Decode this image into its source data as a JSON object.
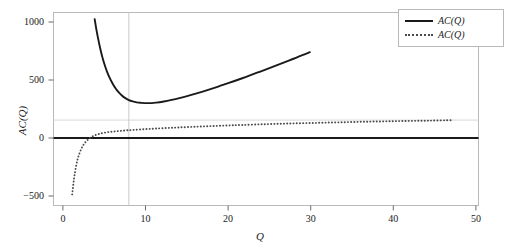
{
  "chart_data": {
    "type": "line",
    "title": "",
    "subtitle": "",
    "xlabel": "Q",
    "ylabel": "AC(Q)",
    "xlim": [
      -1.2,
      53.5
    ],
    "ylim": [
      -620,
      1120
    ],
    "xticks": [
      0,
      10,
      20,
      30,
      40,
      50
    ],
    "xtick_labels": [
      "0",
      "10",
      "20",
      "30",
      "40",
      "50"
    ],
    "yticks": [
      -500,
      0,
      500,
      1000
    ],
    "ytick_labels": [
      "−500",
      "0",
      "500",
      "1000"
    ],
    "grid": true,
    "gridlines": {
      "horizontal": [
        150
      ],
      "vertical": [
        8.5
      ]
    },
    "legend_position": "top-right",
    "annotations": [],
    "series": [
      {
        "name": "AC(Q)",
        "style": "solid",
        "color": "#1a1a1a",
        "x": [
          4.1,
          4.3,
          4.5,
          4.8,
          5.1,
          5.4,
          5.7,
          6.0,
          6.4,
          6.8,
          7.2,
          7.6,
          8.0,
          8.5,
          9.0,
          9.5,
          10.0,
          11.0,
          12.0,
          13.0,
          14.0,
          15.0,
          16.0,
          17.0,
          18.0,
          19.0,
          20.0,
          21.0,
          22.0,
          23.0,
          24.0,
          25.0,
          26.0,
          27.0,
          28.0,
          29.0,
          30.0,
          31.0,
          31.8
        ],
        "y": [
          1060,
          975,
          900,
          800,
          715,
          645,
          585,
          535,
          480,
          435,
          400,
          372,
          350,
          330,
          318,
          310,
          306,
          303,
          308,
          318,
          332,
          348,
          366,
          386,
          407,
          429,
          452,
          476,
          500,
          525,
          551,
          577,
          603,
          630,
          657,
          684,
          712,
          740,
          762
        ]
      },
      {
        "name": "AC(Q)",
        "style": "dotted",
        "color": "#4a4a4a",
        "x": [
          1.2,
          1.3,
          1.4,
          1.5,
          1.7,
          1.9,
          2.1,
          2.4,
          2.7,
          3.0,
          3.4,
          3.8,
          4.2,
          4.7,
          5.2,
          5.8,
          6.4,
          7.0,
          7.6,
          8.3,
          9.0,
          10.0,
          11.0,
          12.0,
          13.5,
          15.0,
          17.0,
          19.0,
          21.0,
          23.0,
          26.0,
          29.0,
          32.0,
          35.0,
          38.0,
          41.0,
          44.0,
          47.0,
          50.0
        ],
        "y": [
          -520,
          -460,
          -400,
          -350,
          -268,
          -205,
          -158,
          -105,
          -68,
          -42,
          -16,
          2,
          15,
          26,
          34,
          41,
          46,
          50,
          54,
          58,
          61,
          66,
          70,
          74,
          79,
          84,
          90,
          96,
          101,
          106,
          113,
          119,
          124,
          129,
          134,
          138,
          142,
          145,
          149
        ]
      }
    ]
  },
  "legend": {
    "entries": [
      {
        "label": "AC(Q)",
        "style": "solid"
      },
      {
        "label": "AC(Q)",
        "style": "dotted"
      }
    ]
  },
  "axes": {
    "x_title": "Q",
    "y_title": "AC(Q)"
  }
}
